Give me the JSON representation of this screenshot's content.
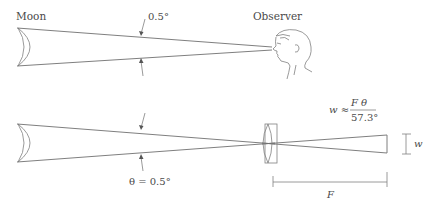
{
  "figure": {
    "top_panel": {
      "moon_label": "Moon",
      "observer_label": "Observer",
      "angle_label": "0.5°"
    },
    "bottom_panel": {
      "angle_label": "θ = 0.5°",
      "formula": {
        "lhs": "w ≈",
        "numerator": "F θ",
        "denominator": "57.3°"
      },
      "image_size_label": "w",
      "focal_length_label": "F"
    },
    "colors": {
      "line": "#707070",
      "text": "#4a4a4a",
      "background": "#ffffff"
    }
  }
}
